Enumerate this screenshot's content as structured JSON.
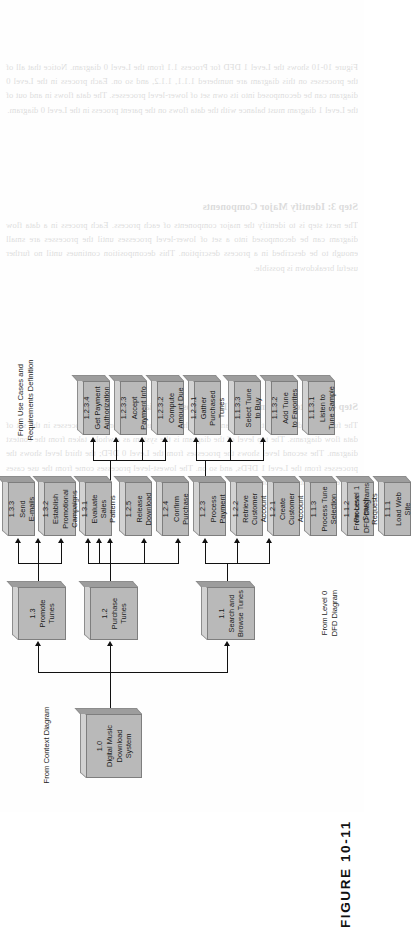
{
  "figure": {
    "caption": "FIGURE 10-11"
  },
  "annotations": [
    {
      "id": "from-context-diagram",
      "text": "From Context Diagram"
    },
    {
      "id": "from-level-0-dfd",
      "text": "From Level 0\nDFD Diagram"
    },
    {
      "id": "from-level-1-dfd",
      "text": "From Level 1\nDFD Diagrams"
    },
    {
      "id": "from-use-cases",
      "text": "From Use Cases and\nRequirements Definition"
    }
  ],
  "nodes": [
    {
      "id": "n-1-0",
      "num": "1.0",
      "title": "Digital Music\nDownload\nSystem"
    },
    {
      "id": "n-1-3",
      "num": "1.3",
      "title": "Promote\nTunes"
    },
    {
      "id": "n-1-2",
      "num": "1.2",
      "title": "Purchase\nTunes"
    },
    {
      "id": "n-1-1",
      "num": "1.1",
      "title": "Search and\nBrowse Tunes"
    },
    {
      "id": "n-1-3-3",
      "num": "1.3.3",
      "title": "Send\nE-mails"
    },
    {
      "id": "n-1-3-2",
      "num": "1.3.2",
      "title": "Establish\nPromotional\nCampaigns"
    },
    {
      "id": "n-1-3-1",
      "num": "1.3.1",
      "title": "Evaluate\nSales Patterns"
    },
    {
      "id": "n-1-2-5",
      "num": "1.2.5",
      "title": "Release\nDownload"
    },
    {
      "id": "n-1-2-4",
      "num": "1.2.4",
      "title": "Confirm\nPurchase"
    },
    {
      "id": "n-1-2-3",
      "num": "1.2.3",
      "title": "Process\nPayment"
    },
    {
      "id": "n-1-2-2",
      "num": "1.2.2",
      "title": "Retrieve Customer\nAccount"
    },
    {
      "id": "n-1-2-1",
      "num": "1.2.1",
      "title": "Create Customer\nAccount"
    },
    {
      "id": "n-1-1-3",
      "num": "1.1.3",
      "title": "Process Tune\nSelection"
    },
    {
      "id": "n-1-1-2",
      "num": "1.1.2",
      "title": "Process Search\nRequests"
    },
    {
      "id": "n-1-1-1",
      "num": "1.1.1",
      "title": "Load Web\nSite"
    },
    {
      "id": "n-1-2-3-4",
      "num": "1.2.3.4",
      "title": "Get Payment\nAuthorization"
    },
    {
      "id": "n-1-2-3-3",
      "num": "1.2.3.3",
      "title": "Accept\nPayment Info"
    },
    {
      "id": "n-1-2-3-2",
      "num": "1.2.3.2",
      "title": "Compute\nAmount Due"
    },
    {
      "id": "n-1-2-3-1",
      "num": "1.2.3.1",
      "title": "Gather\nPurchased Tunes"
    },
    {
      "id": "n-1-1-3-3",
      "num": "1.1.3.3",
      "title": "Select Tune\nto Buy"
    },
    {
      "id": "n-1-1-3-2",
      "num": "1.1.3.2",
      "title": "Add Tune\nto Favorites"
    },
    {
      "id": "n-1-1-3-1",
      "num": "1.1.3.1",
      "title": "Listen to\nTune Sample"
    }
  ],
  "bleed_text": {
    "p1": "Figure 10-10 shows the Level 1 DFD for Process 1.1 from the Level 0 diagram. Notice that all of the processes on this diagram are numbered 1.1.1, 1.1.2, and so on. Each process in the Level 0 diagram can be decomposed into its own set of lower-level processes. The data flows in and out of the Level 1 diagram must balance with the data flows on the parent process in the Level 0 diagram.",
    "h1": "Step 3: Identify Major Components",
    "p2": "The next step is to identify the major components of each process. Each process in a data flow diagram can be decomposed into a set of lower-level processes until the processes are small enough to be described in a process description. This decomposition continues until no further useful breakdown is possible.",
    "h2": "Step 4: Create the Functional Decomposition Diagram",
    "p3": "The functional decomposition diagram shows the relationships among the processes in the set of data flow diagrams. The top level of the diagram is the system as a whole, taken from the context diagram. The second level shows the processes from the Level 0 DFD; the third level shows the processes from the Level 1 DFDs, and so on. The lowest-level processes come from the use cases and requirements definition."
  }
}
